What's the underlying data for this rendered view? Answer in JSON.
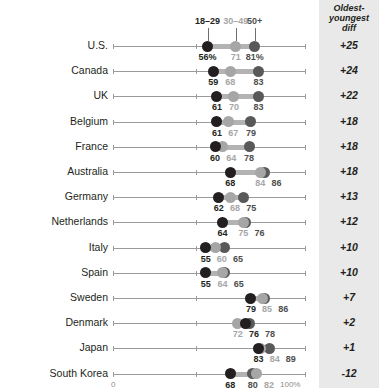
{
  "legend": {
    "young_label": "18–29",
    "mid_label": "30–49",
    "old_label": "50+"
  },
  "diff_column": {
    "header_line1": "Oldest-",
    "header_line2": "youngest",
    "header_line3": "diff"
  },
  "axis": {
    "min_label": "0",
    "max_label": "100%"
  },
  "colors": {
    "young_dot": "#231f20",
    "mid_dot": "#a6a6a6",
    "old_dot": "#595959",
    "connector": "#b3b3b3",
    "axis": "#9b9b9b",
    "panel_background": "#e9e9e9"
  },
  "chart_data": {
    "type": "scatter",
    "title": "",
    "xlabel": "",
    "ylabel": "",
    "xlim": [
      0,
      100
    ],
    "grid": false,
    "legend_position": "top",
    "categories": [
      "U.S.",
      "Canada",
      "UK",
      "Belgium",
      "France",
      "Australia",
      "Germany",
      "Netherlands",
      "Italy",
      "Spain",
      "Sweden",
      "Denmark",
      "Japan",
      "South Korea"
    ],
    "series": [
      {
        "name": "18–29",
        "values": [
          56,
          59,
          61,
          61,
          60,
          68,
          62,
          64,
          55,
          55,
          79,
          72,
          83,
          68
        ]
      },
      {
        "name": "30–49",
        "values": [
          71,
          68,
          70,
          67,
          64,
          84,
          68,
          75,
          60,
          64,
          85,
          76,
          84,
          80
        ]
      },
      {
        "name": "50+",
        "values": [
          81,
          83,
          83,
          79,
          78,
          86,
          75,
          76,
          65,
          65,
          86,
          78,
          89,
          82
        ]
      }
    ],
    "diffs": [
      "+25",
      "+24",
      "+22",
      "+18",
      "+18",
      "+18",
      "+13",
      "+12",
      "+10",
      "+10",
      "+7",
      "+2",
      "+1",
      "-12"
    ]
  },
  "rows": [
    {
      "country": "U.S.",
      "diff": "+25",
      "young": {
        "value": 56,
        "label": "56%"
      },
      "mid": {
        "value": 71,
        "label": "71"
      },
      "old": {
        "value": 81,
        "label": "81%"
      }
    },
    {
      "country": "Canada",
      "diff": "+24",
      "young": {
        "value": 59,
        "label": "59"
      },
      "mid": {
        "value": 68,
        "label": "68"
      },
      "old": {
        "value": 83,
        "label": "83"
      }
    },
    {
      "country": "UK",
      "diff": "+22",
      "young": {
        "value": 61,
        "label": "61"
      },
      "mid": {
        "value": 70,
        "label": "70"
      },
      "old": {
        "value": 83,
        "label": "83"
      }
    },
    {
      "country": "Belgium",
      "diff": "+18",
      "young": {
        "value": 61,
        "label": "61"
      },
      "mid": {
        "value": 67,
        "label": "67"
      },
      "old": {
        "value": 79,
        "label": "79"
      }
    },
    {
      "country": "France",
      "diff": "+18",
      "young": {
        "value": 60,
        "label": "60"
      },
      "mid": {
        "value": 64,
        "label": "64"
      },
      "old": {
        "value": 78,
        "label": "78"
      }
    },
    {
      "country": "Australia",
      "diff": "+18",
      "young": {
        "value": 68,
        "label": "68"
      },
      "mid": {
        "value": 84,
        "label": "84"
      },
      "old": {
        "value": 86,
        "label": "86"
      }
    },
    {
      "country": "Germany",
      "diff": "+13",
      "young": {
        "value": 62,
        "label": "62"
      },
      "mid": {
        "value": 68,
        "label": "68"
      },
      "old": {
        "value": 75,
        "label": "75"
      }
    },
    {
      "country": "Netherlands",
      "diff": "+12",
      "young": {
        "value": 64,
        "label": "64"
      },
      "mid": {
        "value": 75,
        "label": "75"
      },
      "old": {
        "value": 76,
        "label": "76"
      }
    },
    {
      "country": "Italy",
      "diff": "+10",
      "young": {
        "value": 55,
        "label": "55"
      },
      "mid": {
        "value": 60,
        "label": "60"
      },
      "old": {
        "value": 65,
        "label": "65"
      }
    },
    {
      "country": "Spain",
      "diff": "+10",
      "young": {
        "value": 55,
        "label": "55"
      },
      "mid": {
        "value": 64,
        "label": "64"
      },
      "old": {
        "value": 65,
        "label": "65"
      }
    },
    {
      "country": "Sweden",
      "diff": "+7",
      "young": {
        "value": 79,
        "label": "79"
      },
      "mid": {
        "value": 85,
        "label": "85"
      },
      "old": {
        "value": 86,
        "label": "86"
      }
    },
    {
      "country": "Denmark",
      "diff": "+2",
      "young": {
        "value": 76,
        "label": "76"
      },
      "mid": {
        "value": 72,
        "label": "72"
      },
      "old": {
        "value": 78,
        "label": "78"
      }
    },
    {
      "country": "Japan",
      "diff": "+1",
      "young": {
        "value": 83,
        "label": "83"
      },
      "mid": {
        "value": 84,
        "label": "84"
      },
      "old": {
        "value": 89,
        "label": "89"
      }
    },
    {
      "country": "South Korea",
      "diff": "-12",
      "young": {
        "value": 68,
        "label": "68"
      },
      "mid": {
        "value": 82,
        "label": "82"
      },
      "old": {
        "value": 80,
        "label": "80"
      }
    }
  ]
}
